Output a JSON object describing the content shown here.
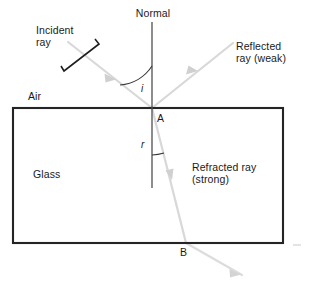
{
  "diagram": {
    "labels": {
      "normal": "Normal",
      "incident_ray": "Incident\nray",
      "reflected_ray": "Reflected\nray (weak)",
      "refracted_ray": "Refracted ray\n(strong)",
      "air": "Air",
      "glass": "Glass",
      "point_a": "A",
      "point_b": "B",
      "angle_incidence": "i",
      "angle_refraction": "r"
    },
    "colors": {
      "ray": "#d6d6d6",
      "block_outline": "#242424",
      "normal_line": "#4a4a4a",
      "arc": "#3a3a3a",
      "pointer": "#1f1f1f",
      "text": "#1a1a1a",
      "background": "#ffffff"
    },
    "geometry": {
      "block": {
        "x": 13,
        "y": 108,
        "width": 270,
        "height": 135
      },
      "normal": {
        "x": 152,
        "y_top": 22,
        "y_bottom": 188
      },
      "point_a": {
        "x": 152,
        "y": 108
      },
      "point_b": {
        "x": 186,
        "y": 243
      },
      "incident_ray": {
        "x1": 72,
        "y1": 45,
        "x2": 152,
        "y2": 108
      },
      "reflected_ray": {
        "x1": 152,
        "y1": 108,
        "x2": 231,
        "y2": 45
      },
      "refracted_ray": {
        "x1": 152,
        "y1": 108,
        "x2": 186,
        "y2": 243
      },
      "emergent_ray": {
        "x1": 186,
        "y1": 243,
        "x2": 240,
        "y2": 274
      }
    }
  }
}
